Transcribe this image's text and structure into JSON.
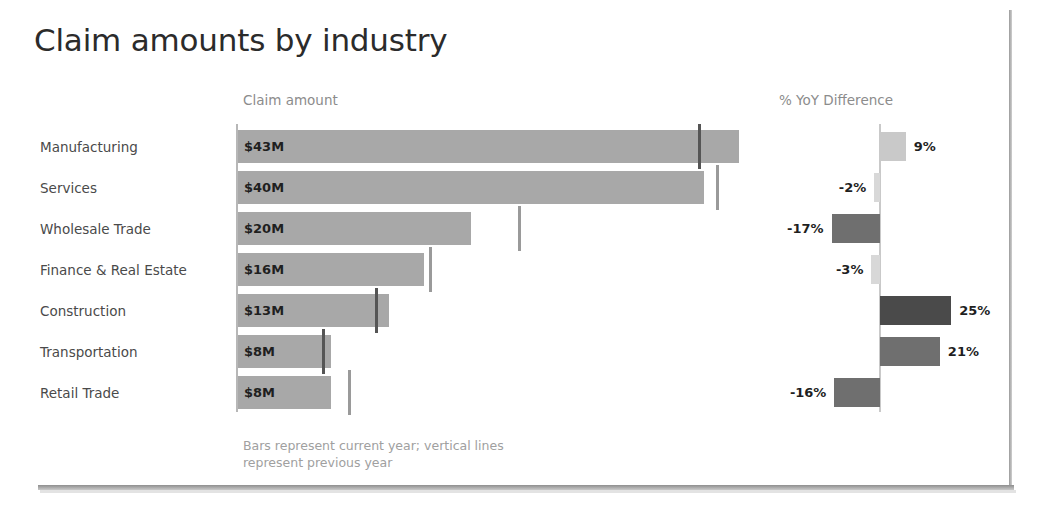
{
  "title": "Claim amounts by industry",
  "headers": {
    "left": "Claim amount",
    "right": "% YoY Difference"
  },
  "footnote_line1": "Bars represent current year; vertical lines",
  "footnote_line2": "represent previous year",
  "colors": {
    "bar_gray": "#a8a8a8",
    "ref_line": "#555555",
    "axis": "#b7b7b7",
    "diff_light": "#c9c9c9",
    "diff_lightest": "#d8d8d8",
    "diff_mid": "#6f6f6f",
    "diff_dark": "#4a4a4a",
    "text": "#4a4a4a",
    "muted": "#a0a0a0"
  },
  "chart_data": {
    "type": "bar",
    "title": "Claim amounts by industry",
    "orientation": "horizontal",
    "categories": [
      "Manufacturing",
      "Services",
      "Wholesale Trade",
      "Finance & Real Estate",
      "Construction",
      "Transportation",
      "Retail Trade"
    ],
    "panels": [
      {
        "name": "Claim amount",
        "xlabel": "Claim amount",
        "unit": "$M",
        "xlim": [
          0,
          50
        ],
        "grid": false,
        "series": [
          {
            "name": "Current year",
            "render": "bar",
            "values": [
              43,
              40,
              20,
              16,
              13,
              8,
              8
            ],
            "labels": [
              "$43M",
              "$40M",
              "$20M",
              "$16M",
              "$13M",
              "$8M",
              "$8M"
            ]
          },
          {
            "name": "Previous year",
            "render": "vertical-line-marker",
            "values": [
              39.5,
              41,
              24,
              16.4,
              11.8,
              7.2,
              9.4
            ]
          }
        ]
      },
      {
        "name": "% YoY Difference",
        "xlabel": "% YoY Difference",
        "unit": "%",
        "xlim": [
          -30,
          30
        ],
        "zero_line": true,
        "grid": false,
        "series": [
          {
            "name": "% YoY Difference",
            "render": "diverging-bar",
            "values": [
              9,
              -2,
              -17,
              -3,
              25,
              21,
              -16
            ],
            "labels": [
              "9%",
              "-2%",
              "-17%",
              "-3%",
              "25%",
              "21%",
              "-16%"
            ]
          }
        ]
      }
    ],
    "rows": [
      {
        "category": "Manufacturing",
        "amount": 43,
        "amount_label": "$43M",
        "prev": 39.5,
        "yoy": 9,
        "yoy_label": "9%"
      },
      {
        "category": "Services",
        "amount": 40,
        "amount_label": "$40M",
        "prev": 41.0,
        "yoy": -2,
        "yoy_label": "-2%"
      },
      {
        "category": "Wholesale Trade",
        "amount": 20,
        "amount_label": "$20M",
        "prev": 24.0,
        "yoy": -17,
        "yoy_label": "-17%"
      },
      {
        "category": "Finance & Real Estate",
        "amount": 16,
        "amount_label": "$16M",
        "prev": 16.4,
        "yoy": -3,
        "yoy_label": "-3%"
      },
      {
        "category": "Construction",
        "amount": 13,
        "amount_label": "$13M",
        "prev": 11.8,
        "yoy": 25,
        "yoy_label": "25%"
      },
      {
        "category": "Transportation",
        "amount": 8,
        "amount_label": "$8M",
        "prev": 7.2,
        "yoy": 21,
        "yoy_label": "21%"
      },
      {
        "category": "Retail Trade",
        "amount": 8,
        "amount_label": "$8M",
        "prev": 9.4,
        "yoy": -16,
        "yoy_label": "-16%"
      }
    ],
    "annotation": "Bars represent current year; vertical lines represent previous year"
  }
}
